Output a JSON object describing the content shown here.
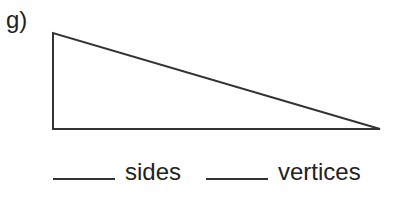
{
  "problem": {
    "label": "g)",
    "shape": "right-triangle",
    "vertices": [
      [
        53,
        33
      ],
      [
        53,
        129
      ],
      [
        380,
        129
      ]
    ],
    "stroke_color": "#333333"
  },
  "answers": [
    {
      "blank": "____",
      "text": "sides"
    },
    {
      "blank": "____",
      "text": "vertices"
    }
  ]
}
